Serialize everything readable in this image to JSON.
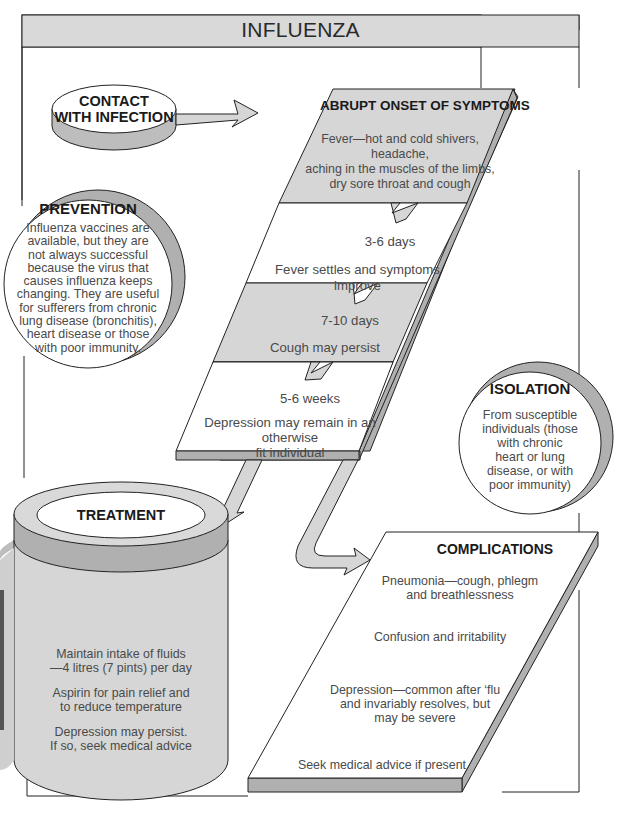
{
  "title": "INFLUENZA",
  "colors": {
    "panel_fill": "#d6d6d6",
    "shadow_fill": "#b0b0b0",
    "stroke": "#222222",
    "background": "#ffffff"
  },
  "contact": {
    "line1": "CONTACT",
    "line2": "WITH INFECTION"
  },
  "onset": {
    "heading": "ABRUPT ONSET OF SYMPTOMS",
    "lines": [
      "Fever—hot and cold shivers, headache,",
      "aching in the muscles of the limbs,",
      "dry sore throat and cough"
    ],
    "stages": [
      {
        "duration": "3-6 days",
        "lines": [
          "Fever settles and symptoms improve"
        ]
      },
      {
        "duration": "7-10 days",
        "lines": [
          "Cough may persist"
        ]
      },
      {
        "duration": "5-6 weeks",
        "lines": [
          "Depression may remain in an otherwise",
          "fit individual"
        ]
      }
    ]
  },
  "prevention": {
    "heading": "PREVENTION",
    "lines": [
      "Influenza vaccines are",
      "available, but they are",
      "not always successful",
      "because the virus that",
      "causes influenza keeps",
      "changing. They are useful",
      "for sufferers from chronic",
      "lung disease (bronchitis),",
      "heart disease or those",
      "with poor immunity."
    ]
  },
  "isolation": {
    "heading": "ISOLATION",
    "lines": [
      "From susceptible",
      "individuals (those",
      "with chronic",
      "heart or lung",
      "disease, or with",
      "poor immunity)"
    ]
  },
  "treatment": {
    "heading": "TREATMENT",
    "items": [
      {
        "lines": [
          "Maintain intake of fluids",
          "—4 litres (7 pints) per day"
        ]
      },
      {
        "lines": [
          "Aspirin for pain relief and",
          "to reduce temperature"
        ]
      },
      {
        "lines": [
          "Depression may persist.",
          "If so, seek medical advice"
        ]
      }
    ]
  },
  "complications": {
    "heading": "COMPLICATIONS",
    "items": [
      {
        "lines": [
          "Pneumonia—cough, phlegm",
          "and breathlessness"
        ]
      },
      {
        "lines": [
          "Confusion and irritability"
        ]
      },
      {
        "lines": [
          "Depression—common after ‘flu",
          "and invariably resolves, but",
          "may be severe"
        ]
      },
      {
        "lines": [
          "Seek medical advice if present"
        ]
      }
    ]
  }
}
